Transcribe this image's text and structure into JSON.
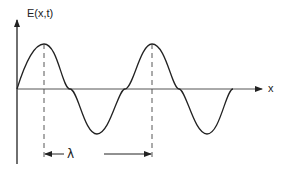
{
  "diagram": {
    "y_axis_label": "E(x,t)",
    "x_axis_label": "x",
    "wavelength_label": "λ",
    "colors": {
      "stroke": "#222222",
      "background": "#ffffff"
    }
  }
}
